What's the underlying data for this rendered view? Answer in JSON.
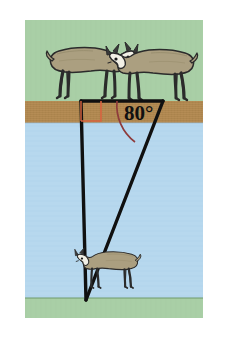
{
  "figure": {
    "canvas": {
      "x": 25,
      "y": 20,
      "width": 178,
      "height": 298
    },
    "background": "#ffffff",
    "bands": [
      {
        "name": "upper-grass",
        "label": "grass",
        "color": "#a9cfa6",
        "y": 0,
        "height": 81
      },
      {
        "name": "dirt-bank",
        "label": "dirt bank",
        "color": "#b28a52",
        "y": 81,
        "height": 22
      },
      {
        "name": "water",
        "label": "water",
        "color": "#b7d8ee",
        "y": 103,
        "height": 175
      },
      {
        "name": "lower-grass",
        "label": "grass",
        "color": "#a9cfa6",
        "y": 278,
        "height": 20
      }
    ],
    "triangle": {
      "stroke": "#101010",
      "stroke_width": 3.4,
      "vertices": {
        "top_left": {
          "x": 56,
          "y": 81
        },
        "top_right": {
          "x": 138,
          "y": 81
        },
        "bottom": {
          "x": 61,
          "y": 280
        }
      }
    },
    "angle": {
      "value_label": "80°",
      "degrees": 80,
      "at_vertex": "top_right",
      "arc_color": "#8e3b3b",
      "label_x": 99,
      "label_y": 100
    },
    "right_angle_marker": {
      "name": "right-angle-marker",
      "color": "#d8633f",
      "degrees": 90,
      "at_vertex": "top_left",
      "size": 20
    },
    "sheep": [
      {
        "name": "sheep-top-left",
        "position": "upper-grass-left",
        "facing": "right",
        "x": 18,
        "y": 14,
        "scale": 1.0,
        "body_color": "#ab9f80",
        "face_color": "#f2f0e6",
        "outline": "#2b2b2b"
      },
      {
        "name": "sheep-top-right",
        "position": "upper-grass-right",
        "facing": "left",
        "x": 94,
        "y": 16,
        "scale": 1.0,
        "body_color": "#ab9f80",
        "face_color": "#f2f0e6",
        "outline": "#2b2b2b"
      },
      {
        "name": "sheep-bottom",
        "position": "lower-grass",
        "facing": "left",
        "x": 26,
        "y": 222,
        "scale": 0.72,
        "body_color": "#ab9f80",
        "face_color": "#f2f0e6",
        "outline": "#2b2b2b"
      }
    ]
  }
}
